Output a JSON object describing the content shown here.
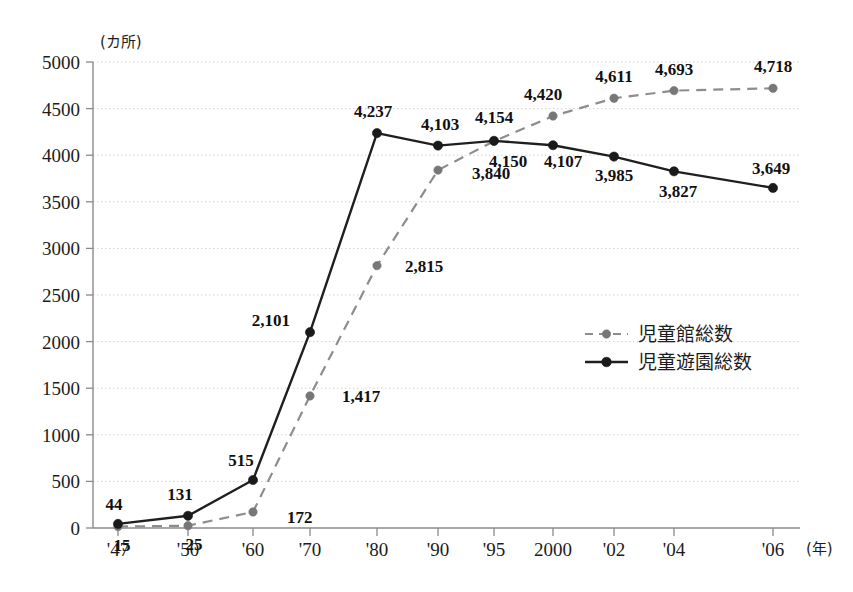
{
  "chart_data": {
    "type": "line",
    "title": "",
    "xlabel": "(年)",
    "ylabel": "(カ所)",
    "y_unit": "(カ所)",
    "x_unit": "(年)",
    "categories": [
      "'47",
      "'50",
      "'60",
      "'70",
      "'80",
      "'90",
      "'95",
      "2000",
      "'02",
      "'04",
      "'06"
    ],
    "ylim": [
      0,
      5000
    ],
    "ytick_labels": [
      "0",
      "500",
      "1000",
      "1500",
      "2000",
      "2500",
      "3000",
      "3500",
      "4000",
      "4500",
      "5000"
    ],
    "ytick_values": [
      0,
      500,
      1000,
      1500,
      2000,
      2500,
      3000,
      3500,
      4000,
      4500,
      5000
    ],
    "grid": true,
    "grid_axis": "y",
    "legend_position": "center-right",
    "series": [
      {
        "name": "児童館総数",
        "style": "dashed",
        "color": "#8d8d8d",
        "values": [
          15,
          25,
          172,
          1417,
          2815,
          3840,
          4150,
          4420,
          4611,
          4693,
          4718
        ],
        "labels": [
          "15",
          "25",
          "172",
          "1,417",
          "2,815",
          "3,840",
          "4,150",
          "4,420",
          "4,611",
          "4,693",
          "4,718"
        ]
      },
      {
        "name": "児童遊園総数",
        "style": "solid",
        "color": "#1f1f1f",
        "values": [
          44,
          131,
          515,
          2101,
          4237,
          4103,
          4154,
          4107,
          3985,
          3827,
          3649
        ],
        "labels": [
          "44",
          "131",
          "515",
          "2,101",
          "4,237",
          "4,103",
          "4,154",
          "4,107",
          "3,985",
          "3,827",
          "3,649"
        ]
      }
    ]
  },
  "legend": {
    "items": [
      {
        "label": "児童館総数",
        "style": "dashed"
      },
      {
        "label": "児童遊園総数",
        "style": "solid"
      }
    ]
  }
}
